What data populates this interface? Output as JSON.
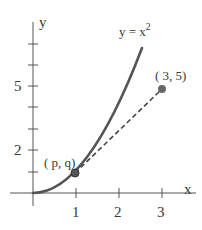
{
  "figure": {
    "axes": {
      "x_label": "x",
      "y_label": "y",
      "x_ticks": [
        {
          "value": 1,
          "label": "1"
        },
        {
          "value": 2,
          "label": "2"
        },
        {
          "value": 3,
          "label": "3"
        }
      ],
      "y_ticks": [
        {
          "value": 1,
          "label": ""
        },
        {
          "value": 2,
          "label": "2"
        },
        {
          "value": 3,
          "label": ""
        },
        {
          "value": 4,
          "label": ""
        },
        {
          "value": 5,
          "label": "5"
        },
        {
          "value": 6,
          "label": ""
        },
        {
          "value": 7,
          "label": ""
        }
      ]
    },
    "curve": {
      "label_prefix": "y = x",
      "label_exponent": "2",
      "equation": "y = x^2",
      "color": "#555555"
    },
    "points": {
      "tangent_point": {
        "label": "( p, q)",
        "x": 1,
        "y": 1
      },
      "external_point": {
        "label": "( 3, 5)",
        "x": 3,
        "y": 5
      }
    },
    "segment": {
      "style": "dashed",
      "color": "#444444"
    }
  }
}
